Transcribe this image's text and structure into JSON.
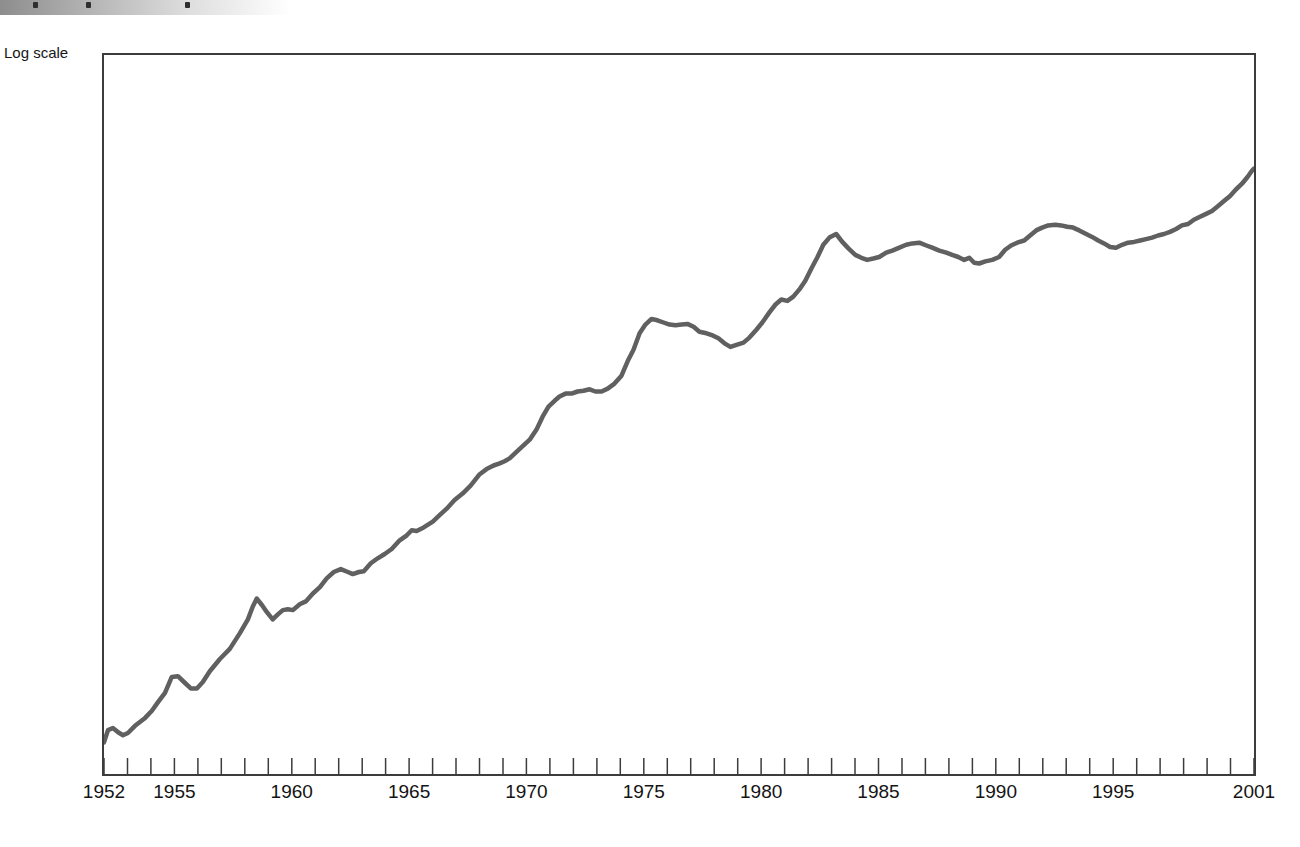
{
  "page": {
    "background": "#ffffff"
  },
  "scan_banner": {
    "gradient_start": "#8d8d8d",
    "gradient_end": "#ffffff",
    "text_fragment_marks_x": [
      33,
      86,
      185
    ]
  },
  "chart_data": {
    "type": "line",
    "title": "",
    "xlabel": "",
    "ylabel": "Log scale",
    "xlim": [
      1952,
      2001
    ],
    "x_minor_tick_interval": 1,
    "x_labeled_ticks": [
      1952,
      1955,
      1960,
      1965,
      1970,
      1975,
      1980,
      1985,
      1990,
      1995,
      2001
    ],
    "y_axis_note": "logarithmic scale, no numeric y tick labels shown in figure",
    "y_unit": "percent_of_plot_height",
    "ylim": [
      0,
      100
    ],
    "grid": false,
    "legend": "none",
    "line_color": "#606060",
    "line_width": 4.5,
    "axis_color": "#3c3c3c",
    "points": [
      [
        1952.0,
        4.4
      ],
      [
        1952.17,
        6.1
      ],
      [
        1952.38,
        6.4
      ],
      [
        1952.6,
        5.8
      ],
      [
        1952.81,
        5.4
      ],
      [
        1953.02,
        5.7
      ],
      [
        1953.32,
        6.7
      ],
      [
        1953.75,
        7.8
      ],
      [
        1954.04,
        8.8
      ],
      [
        1954.3,
        10.0
      ],
      [
        1954.6,
        11.3
      ],
      [
        1954.89,
        13.5
      ],
      [
        1955.15,
        13.6
      ],
      [
        1955.41,
        12.8
      ],
      [
        1955.7,
        11.9
      ],
      [
        1955.96,
        11.9
      ],
      [
        1956.21,
        12.8
      ],
      [
        1956.51,
        14.3
      ],
      [
        1956.94,
        16.0
      ],
      [
        1957.36,
        17.4
      ],
      [
        1957.79,
        19.6
      ],
      [
        1958.13,
        21.5
      ],
      [
        1958.34,
        23.3
      ],
      [
        1958.51,
        24.4
      ],
      [
        1958.73,
        23.5
      ],
      [
        1958.94,
        22.5
      ],
      [
        1959.19,
        21.5
      ],
      [
        1959.41,
        22.2
      ],
      [
        1959.62,
        22.8
      ],
      [
        1959.83,
        22.9
      ],
      [
        1960.05,
        22.8
      ],
      [
        1960.34,
        23.6
      ],
      [
        1960.6,
        24.0
      ],
      [
        1960.9,
        25.1
      ],
      [
        1961.2,
        26.0
      ],
      [
        1961.49,
        27.2
      ],
      [
        1961.79,
        28.1
      ],
      [
        1962.09,
        28.5
      ],
      [
        1962.39,
        28.1
      ],
      [
        1962.6,
        27.8
      ],
      [
        1962.86,
        28.1
      ],
      [
        1963.07,
        28.2
      ],
      [
        1963.37,
        29.3
      ],
      [
        1963.66,
        30.0
      ],
      [
        1963.96,
        30.6
      ],
      [
        1964.26,
        31.3
      ],
      [
        1964.6,
        32.5
      ],
      [
        1964.9,
        33.2
      ],
      [
        1965.11,
        33.9
      ],
      [
        1965.32,
        33.8
      ],
      [
        1965.62,
        34.3
      ],
      [
        1966.01,
        35.1
      ],
      [
        1966.3,
        36.0
      ],
      [
        1966.6,
        36.9
      ],
      [
        1966.94,
        38.1
      ],
      [
        1967.28,
        39.0
      ],
      [
        1967.62,
        40.1
      ],
      [
        1968.01,
        41.7
      ],
      [
        1968.3,
        42.4
      ],
      [
        1968.6,
        42.9
      ],
      [
        1968.86,
        43.2
      ],
      [
        1969.07,
        43.5
      ],
      [
        1969.28,
        43.9
      ],
      [
        1969.54,
        44.7
      ],
      [
        1969.84,
        45.6
      ],
      [
        1970.14,
        46.5
      ],
      [
        1970.43,
        47.9
      ],
      [
        1970.69,
        49.7
      ],
      [
        1970.94,
        51.1
      ],
      [
        1971.2,
        51.9
      ],
      [
        1971.41,
        52.5
      ],
      [
        1971.67,
        52.9
      ],
      [
        1971.92,
        52.9
      ],
      [
        1972.18,
        53.2
      ],
      [
        1972.43,
        53.3
      ],
      [
        1972.69,
        53.5
      ],
      [
        1972.94,
        53.2
      ],
      [
        1973.2,
        53.2
      ],
      [
        1973.46,
        53.6
      ],
      [
        1973.75,
        54.3
      ],
      [
        1974.05,
        55.4
      ],
      [
        1974.31,
        57.4
      ],
      [
        1974.56,
        59.0
      ],
      [
        1974.82,
        61.3
      ],
      [
        1975.07,
        62.5
      ],
      [
        1975.33,
        63.3
      ],
      [
        1975.58,
        63.1
      ],
      [
        1975.84,
        62.8
      ],
      [
        1976.1,
        62.5
      ],
      [
        1976.35,
        62.4
      ],
      [
        1976.61,
        62.5
      ],
      [
        1976.86,
        62.6
      ],
      [
        1977.12,
        62.2
      ],
      [
        1977.37,
        61.5
      ],
      [
        1977.67,
        61.3
      ],
      [
        1977.93,
        61.0
      ],
      [
        1978.18,
        60.6
      ],
      [
        1978.44,
        59.9
      ],
      [
        1978.69,
        59.4
      ],
      [
        1978.95,
        59.7
      ],
      [
        1979.25,
        60.0
      ],
      [
        1979.5,
        60.7
      ],
      [
        1979.8,
        61.8
      ],
      [
        1980.05,
        62.8
      ],
      [
        1980.35,
        64.2
      ],
      [
        1980.61,
        65.3
      ],
      [
        1980.86,
        66.0
      ],
      [
        1981.12,
        65.8
      ],
      [
        1981.37,
        66.4
      ],
      [
        1981.63,
        67.4
      ],
      [
        1981.88,
        68.6
      ],
      [
        1982.14,
        70.3
      ],
      [
        1982.4,
        71.9
      ],
      [
        1982.65,
        73.6
      ],
      [
        1982.91,
        74.6
      ],
      [
        1983.2,
        75.1
      ],
      [
        1983.46,
        74.0
      ],
      [
        1983.72,
        73.1
      ],
      [
        1984.01,
        72.2
      ],
      [
        1984.27,
        71.8
      ],
      [
        1984.52,
        71.5
      ],
      [
        1984.78,
        71.7
      ],
      [
        1985.03,
        71.9
      ],
      [
        1985.33,
        72.5
      ],
      [
        1985.59,
        72.8
      ],
      [
        1985.89,
        73.2
      ],
      [
        1986.18,
        73.6
      ],
      [
        1986.44,
        73.8
      ],
      [
        1986.74,
        73.9
      ],
      [
        1987.04,
        73.5
      ],
      [
        1987.29,
        73.2
      ],
      [
        1987.59,
        72.8
      ],
      [
        1987.89,
        72.5
      ],
      [
        1988.14,
        72.2
      ],
      [
        1988.4,
        71.9
      ],
      [
        1988.65,
        71.5
      ],
      [
        1988.87,
        71.8
      ],
      [
        1989.08,
        71.1
      ],
      [
        1989.29,
        71.0
      ],
      [
        1989.55,
        71.3
      ],
      [
        1989.85,
        71.5
      ],
      [
        1990.14,
        71.9
      ],
      [
        1990.4,
        72.9
      ],
      [
        1990.65,
        73.5
      ],
      [
        1990.91,
        73.9
      ],
      [
        1991.21,
        74.2
      ],
      [
        1991.46,
        74.9
      ],
      [
        1991.72,
        75.6
      ],
      [
        1991.97,
        76.0
      ],
      [
        1992.23,
        76.3
      ],
      [
        1992.53,
        76.4
      ],
      [
        1992.78,
        76.3
      ],
      [
        1993.04,
        76.1
      ],
      [
        1993.29,
        76.0
      ],
      [
        1993.55,
        75.6
      ],
      [
        1993.85,
        75.1
      ],
      [
        1994.1,
        74.7
      ],
      [
        1994.36,
        74.2
      ],
      [
        1994.61,
        73.8
      ],
      [
        1994.87,
        73.3
      ],
      [
        1995.12,
        73.2
      ],
      [
        1995.38,
        73.6
      ],
      [
        1995.63,
        73.9
      ],
      [
        1995.89,
        74.0
      ],
      [
        1996.15,
        74.2
      ],
      [
        1996.4,
        74.4
      ],
      [
        1996.66,
        74.6
      ],
      [
        1996.91,
        74.9
      ],
      [
        1997.17,
        75.1
      ],
      [
        1997.42,
        75.4
      ],
      [
        1997.68,
        75.8
      ],
      [
        1997.93,
        76.3
      ],
      [
        1998.19,
        76.5
      ],
      [
        1998.44,
        77.1
      ],
      [
        1998.7,
        77.5
      ],
      [
        1998.96,
        77.9
      ],
      [
        1999.21,
        78.3
      ],
      [
        1999.47,
        79.0
      ],
      [
        1999.72,
        79.7
      ],
      [
        1999.98,
        80.4
      ],
      [
        2000.23,
        81.3
      ],
      [
        2000.49,
        82.1
      ],
      [
        2000.74,
        83.1
      ],
      [
        2000.91,
        83.9
      ],
      [
        2001.0,
        84.2
      ]
    ]
  }
}
